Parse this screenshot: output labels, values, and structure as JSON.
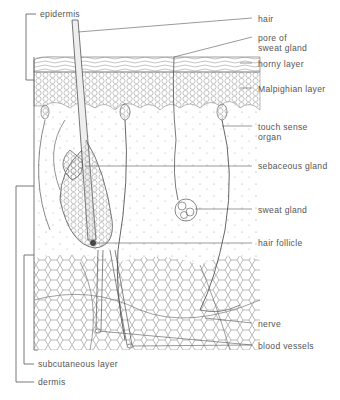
{
  "diagram": {
    "title": "",
    "line_color": "#555555",
    "labels": {
      "epidermis": "epidermis",
      "hair": "hair",
      "pore_line1": "pore of",
      "pore_line2": "sweat gland",
      "horny_layer": "horny layer",
      "malpighian_layer": "Malpighian layer",
      "touch_line1": "touch sense",
      "touch_line2": "organ",
      "sebaceous_gland": "sebaceous gland",
      "sweat_gland": "sweat gland",
      "hair_follicle": "hair follicle",
      "nerve": "nerve",
      "blood_vessels": "blood vessels",
      "subcutaneous_layer": "subcutaneous layer",
      "dermis": "dermis"
    }
  }
}
